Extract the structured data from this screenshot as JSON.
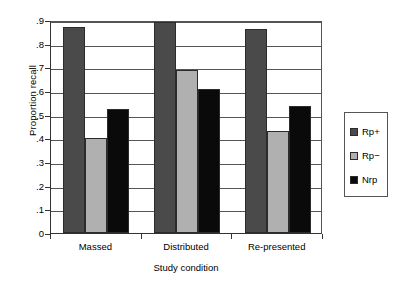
{
  "chart_data": {
    "type": "bar",
    "title": "",
    "xlabel": "Study condition",
    "ylabel": "Proportion recall",
    "categories": [
      "Massed",
      "Distributed",
      "Re-presented"
    ],
    "series": [
      {
        "name": "Rp+",
        "color": "#4a4a4a",
        "values": [
          0.87,
          0.89,
          0.86
        ]
      },
      {
        "name": "Rp−",
        "color": "#b0b0b0",
        "values": [
          0.4,
          0.69,
          0.43
        ]
      },
      {
        "name": "Nrp",
        "color": "#0a0a0a",
        "values": [
          0.525,
          0.61,
          0.535
        ]
      }
    ],
    "ylim": [
      0,
      0.9
    ],
    "yticks": [
      0,
      0.1,
      0.2,
      0.3,
      0.4,
      0.5,
      0.6,
      0.7,
      0.8,
      0.9
    ],
    "ytick_labels": [
      "0",
      ".1",
      ".2",
      ".3",
      ".4",
      ".5",
      ".6",
      ".7",
      ".8",
      ".9"
    ],
    "grid": true,
    "grid_axis": "y",
    "legend_position": "right-outside",
    "legend_entries": [
      "Rp+",
      "Rp−",
      "Nrp"
    ]
  },
  "axes": {
    "y_title": "Proportion recall",
    "x_title": "Study condition"
  }
}
